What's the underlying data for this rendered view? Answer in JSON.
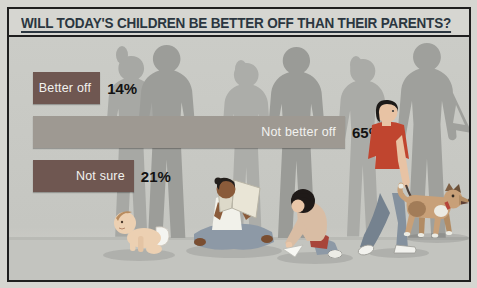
{
  "page": {
    "title": "WILL TODAY'S CHILDREN BE BETTER OFF THAN THEIR PARENTS?"
  },
  "chart_data": {
    "type": "bar",
    "orientation": "horizontal",
    "title": "WILL TODAY'S CHILDREN BE BETTER OFF THAN THEIR PARENTS?",
    "categories": [
      "Better off",
      "Not better off",
      "Not sure"
    ],
    "values": [
      14,
      65,
      21
    ],
    "value_labels": [
      "14%",
      "65%",
      "21%"
    ],
    "xlabel": "",
    "ylabel": "",
    "xlim": [
      0,
      100
    ],
    "grid": false,
    "legend": false,
    "label_position": "inside-right",
    "value_label_position": "outside-right",
    "bars": [
      {
        "label": "Better off",
        "value": 14,
        "value_label": "14%",
        "color": "#6f5751"
      },
      {
        "label": "Not better off",
        "value": 65,
        "value_label": "65%",
        "color": "#9e9992"
      },
      {
        "label": "Not sure",
        "value": 21,
        "value_label": "21%",
        "color": "#6f5751"
      }
    ]
  },
  "illustration": {
    "background_figures": "adult-parent-silhouettes",
    "foreground_figures": [
      "crawling-baby",
      "child-reading-book",
      "girl-folding-paper",
      "boy-walking-dog",
      "dog-on-leash"
    ]
  },
  "colors": {
    "page_bg": "#d6d6d1",
    "frame_border": "#1f1f1f",
    "title_text": "#2b3640",
    "chart_bg": "#c7c8c3",
    "silhouette_light": "#abaca8",
    "silhouette_dark": "#9c9d99",
    "bar_dark": "#6f5751",
    "bar_light": "#9e9992",
    "bar_label_text": "#f2f2ef",
    "value_text": "#121212",
    "boy_shirt": "#c0452f",
    "dog_coat": "#c8a078"
  }
}
